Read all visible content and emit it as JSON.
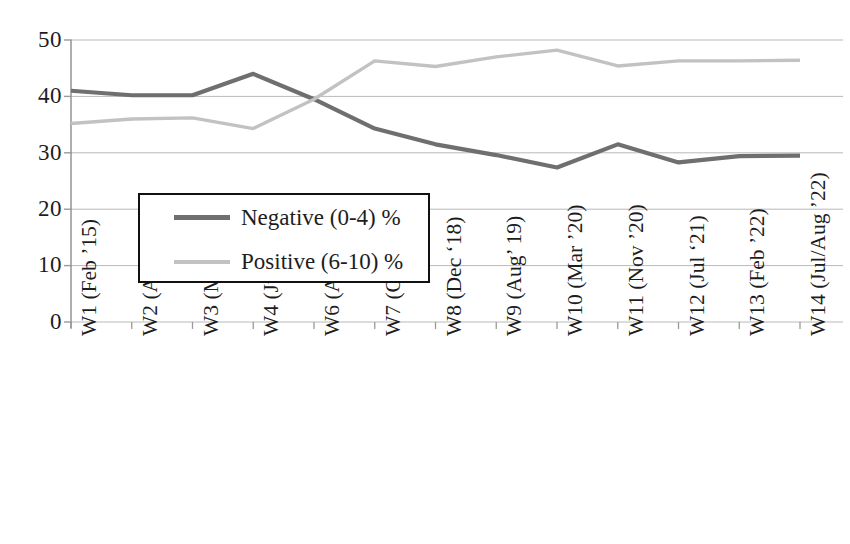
{
  "chart_data": {
    "type": "line",
    "title": "",
    "subtitle": "",
    "xlabel": "",
    "ylabel": "",
    "ylim": [
      0,
      50
    ],
    "y_ticks": [
      0,
      10,
      20,
      30,
      40,
      50
    ],
    "y_tick_labels": [
      "0",
      "10",
      "20",
      "30",
      "40",
      "50"
    ],
    "grid": true,
    "grid_axis": "y",
    "legend_position": "inside-left-middle",
    "categories": [
      "W1 (Feb ’15)",
      "W2 (Apr ’15)",
      "W3 (May ’15)",
      "W4 (Jun ’15)",
      "W6 (Apr’16)",
      "W7 (Oct ’16)",
      "W8 (Dec ‘18)",
      "W9 (Aug’ 19)",
      "W10 (Mar ’20)",
      "W11 (Nov ’20)",
      "W12 (Jul ‘21)",
      "W13 (Feb ’22)",
      "W14 (Jul/Aug ’22)"
    ],
    "series": [
      {
        "name": "Negative (0-4) %",
        "color": "#6f6f6f",
        "values": [
          41.0,
          40.2,
          40.2,
          44.0,
          39.5,
          34.3,
          31.5,
          29.6,
          27.4,
          31.5,
          28.3,
          29.4,
          29.5
        ]
      },
      {
        "name": "Positive (6-10) %",
        "color": "#c2c2c2",
        "values": [
          35.2,
          36.0,
          36.2,
          34.3,
          39.5,
          46.3,
          45.3,
          47.0,
          48.2,
          45.4,
          46.3,
          46.3,
          46.4
        ]
      }
    ]
  },
  "legend": {
    "entries": [
      {
        "label": "Negative (0-4) %",
        "swatch": "line-swatch-dark-gray"
      },
      {
        "label": "Positive (6-10) %",
        "swatch": "line-swatch-light-gray"
      }
    ]
  },
  "axes": {
    "y_tick_labels": [
      "50",
      "40",
      "30",
      "20",
      "10",
      "0"
    ]
  },
  "colors": {
    "negative_line": "#6f6f6f",
    "positive_line": "#c2c2c2",
    "gridline": "#b9b9b9",
    "axis": "#9a9a9a",
    "text": "#1d1d1d",
    "legend_border": "#111111",
    "background": "#ffffff"
  }
}
